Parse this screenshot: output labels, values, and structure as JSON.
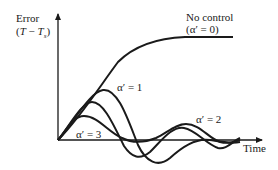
{
  "figure": {
    "y_axis": {
      "label_line1": "Error",
      "label_line2_prefix": "(",
      "label_T": "T",
      "label_minus": " − ",
      "label_Ts": "T",
      "label_sub": "s",
      "label_suffix": ")"
    },
    "x_axis": {
      "label": "Time"
    },
    "curves": [
      {
        "id": "no-control",
        "label_line1": "No control",
        "label_line2": "(α′ = 0)"
      },
      {
        "id": "alpha-1",
        "label": "α′ = 1"
      },
      {
        "id": "alpha-2",
        "label": "α′ = 2"
      },
      {
        "id": "alpha-3",
        "label": "α′ = 3"
      }
    ],
    "colors": {
      "ink": "#1a1a1a",
      "background": "#ffffff"
    }
  }
}
